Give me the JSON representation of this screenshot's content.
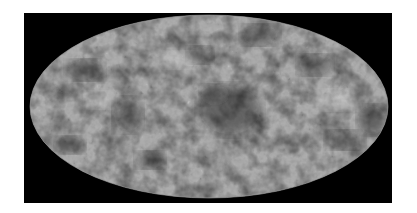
{
  "image": {
    "subject": "all-sky map in Mollweide projection",
    "background_color": "#000000",
    "page_color": "#ffffff",
    "map": {
      "shape": "ellipse",
      "base_gray": "#8a8a8a",
      "colormap": [
        "#000000",
        "#8a8a8a",
        "#ffffff"
      ],
      "features": [
        {
          "type": "dark-region",
          "location": "center"
        },
        {
          "type": "dark-region",
          "location": "upper-left"
        },
        {
          "type": "dark-region",
          "location": "left"
        },
        {
          "type": "dark-region",
          "location": "lower-left"
        },
        {
          "type": "dark-region",
          "location": "upper-right"
        },
        {
          "type": "dark-region",
          "location": "far-right"
        },
        {
          "type": "bright-speckle-region",
          "location": "right"
        }
      ]
    }
  }
}
